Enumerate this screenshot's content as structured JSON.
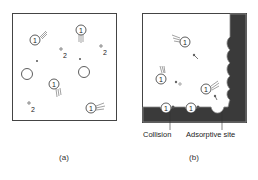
{
  "panels": {
    "a": {
      "caption": "(a)",
      "molecule_label": "1",
      "atom_label": "2"
    },
    "b": {
      "caption": "(b)",
      "molecule_label": "1",
      "labels": {
        "collision": "Collision",
        "adsorptive_site": "Adsorptive site"
      }
    }
  },
  "colors": {
    "line": "#333333",
    "surface": "#3a3a3a",
    "surface_edge": "#8a8a8a",
    "background": "#ffffff"
  }
}
